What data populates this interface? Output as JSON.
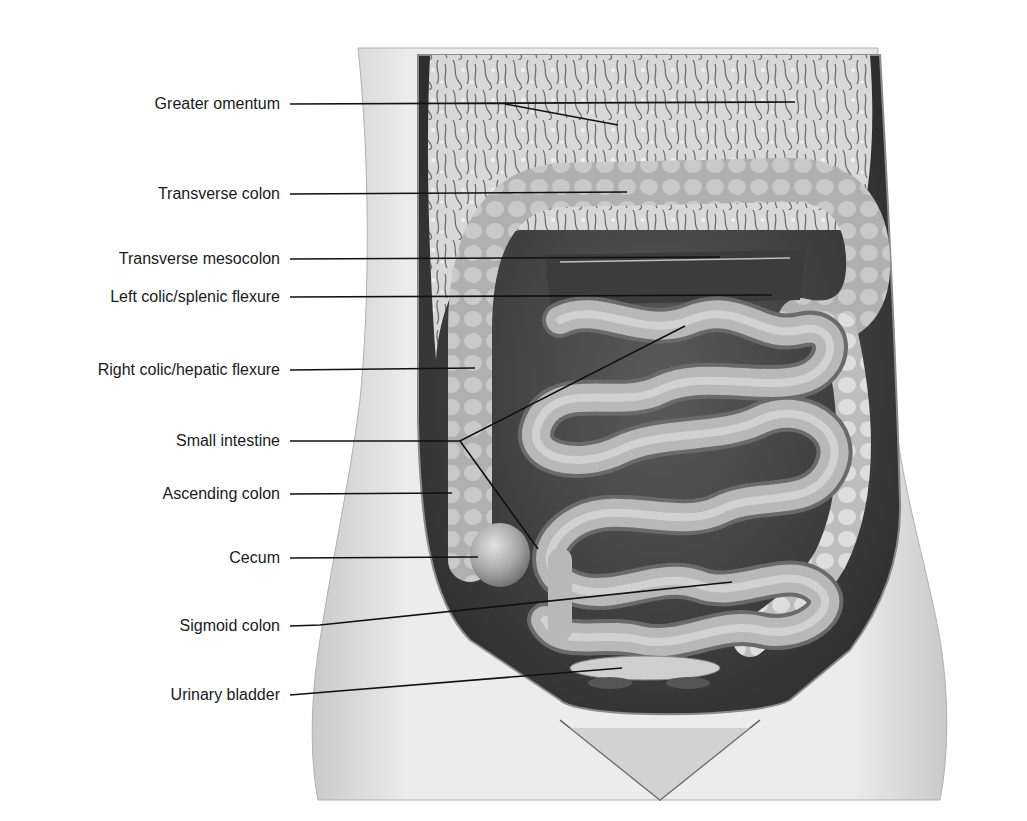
{
  "diagram": {
    "type": "anatomy-labeled-illustration",
    "colors": {
      "background": "#ffffff",
      "leader_line": "#111111",
      "label_text": "#1a1a1a",
      "skin": "#dcdcdc",
      "organ": "#a8a8a8"
    },
    "labels": [
      {
        "id": "greater-omentum",
        "text": "Greater omentum",
        "y": 104
      },
      {
        "id": "transverse-colon",
        "text": "Transverse colon",
        "y": 194
      },
      {
        "id": "transverse-mesocolon",
        "text": "Transverse mesocolon",
        "y": 259
      },
      {
        "id": "left-colic-flexure",
        "text": "Left colic/splenic flexure",
        "y": 297
      },
      {
        "id": "right-colic-flexure",
        "text": "Right colic/hepatic flexure",
        "y": 370
      },
      {
        "id": "small-intestine",
        "text": "Small intestine",
        "y": 441
      },
      {
        "id": "ascending-colon",
        "text": "Ascending colon",
        "y": 494
      },
      {
        "id": "cecum",
        "text": "Cecum",
        "y": 558
      },
      {
        "id": "sigmoid-colon",
        "text": "Sigmoid colon",
        "y": 626
      },
      {
        "id": "urinary-bladder",
        "text": "Urinary bladder",
        "y": 695
      }
    ]
  }
}
